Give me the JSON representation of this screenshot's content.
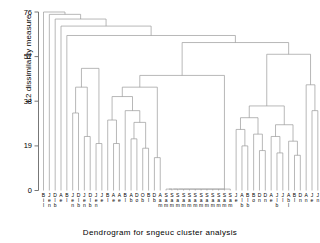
{
  "chart_data": {
    "type": "dendrogram",
    "title": "",
    "xlabel": "Dendrogram for sngeuc cluster analysis",
    "ylabel": "L2 dissimilarity measure",
    "yticks": [
      0,
      19,
      38,
      57,
      76
    ],
    "ylim": [
      0,
      78
    ],
    "grid": false,
    "legend": null,
    "n_leaves": 47,
    "leaf_labels": [
      "B\ni\nl",
      "J\ne\nn",
      "D\nl\nb",
      "A\ne",
      "B\nl",
      "J\ne\nn",
      "D\nl\nb",
      "J\ne\nn",
      "D\nl\nb",
      "J\ne\nn",
      "J\ne",
      "B\nl",
      "A\ne",
      "A\ne",
      "B\nl",
      "A\nb",
      "D\no",
      "O\nb",
      "B\nl",
      "D\nb",
      "A\na\nm",
      "S\na\nm",
      "S\na\nm",
      "S\na\nm",
      "S\na\nm",
      "S\na\nm",
      "S\na\nm",
      "S\na\nm",
      "S\na\nm",
      "S\na\nm",
      "S\na\nm",
      "S\na\nm",
      "S\na\nm",
      "J\ne",
      "A\nl\nb",
      "B\nl\nb",
      "B\no",
      "D\nn",
      "D\nn",
      "A\ne",
      "J\nl\nb",
      "J\nl",
      "A\nb\nl",
      "B\nl",
      "D\nn",
      "A\nn",
      "J\ne",
      "J\nn"
    ],
    "merge_heights": [
      76,
      70,
      63,
      59,
      57,
      52,
      48,
      45,
      41,
      38,
      34,
      30,
      27,
      24,
      21,
      18,
      15,
      12,
      9,
      6,
      3,
      1
    ],
    "line_color": "#9a9a9a",
    "axis_color": "#777777",
    "text_color": "#000000"
  },
  "axis": {
    "ylabel": "L2 dissimilarity measure",
    "xlabel": "Dendrogram for sngeuc cluster analysis",
    "tick_0": "0",
    "tick_1": "19",
    "tick_2": "38",
    "tick_3": "57",
    "tick_4": "76"
  }
}
